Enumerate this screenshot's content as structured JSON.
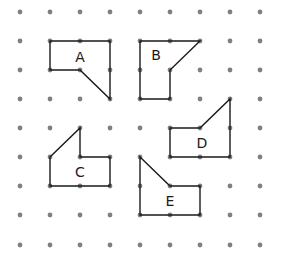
{
  "grid": {
    "cols": 9,
    "rows": 9,
    "x": [
      20,
      50,
      80,
      110,
      140,
      170,
      200,
      230,
      260
    ],
    "y": [
      12,
      41,
      70,
      99,
      128,
      157,
      186,
      215,
      245
    ],
    "dot_color": "#808080"
  },
  "shapes": [
    {
      "label": "A",
      "points": [
        [
          1,
          1
        ],
        [
          3,
          1
        ],
        [
          3,
          3
        ],
        [
          2,
          2
        ],
        [
          1,
          2
        ]
      ],
      "label_pos": [
        80,
        57
      ]
    },
    {
      "label": "B",
      "points": [
        [
          4,
          1
        ],
        [
          6,
          1
        ],
        [
          5,
          2
        ],
        [
          5,
          3
        ],
        [
          4,
          3
        ]
      ],
      "label_pos": [
        156,
        55
      ]
    },
    {
      "label": "C",
      "points": [
        [
          1,
          5
        ],
        [
          2,
          4
        ],
        [
          2,
          5
        ],
        [
          3,
          5
        ],
        [
          3,
          6
        ],
        [
          1,
          6
        ]
      ],
      "label_pos": [
        80,
        172
      ]
    },
    {
      "label": "D",
      "points": [
        [
          5,
          4
        ],
        [
          6,
          4
        ],
        [
          7,
          3
        ],
        [
          7,
          5
        ],
        [
          5,
          5
        ]
      ],
      "label_pos": [
        202,
        143
      ]
    },
    {
      "label": "E",
      "points": [
        [
          4,
          5
        ],
        [
          5,
          6
        ],
        [
          6,
          6
        ],
        [
          6,
          7
        ],
        [
          4,
          7
        ]
      ],
      "label_pos": [
        170,
        201
      ]
    }
  ],
  "line_color": "#1a1a1a"
}
